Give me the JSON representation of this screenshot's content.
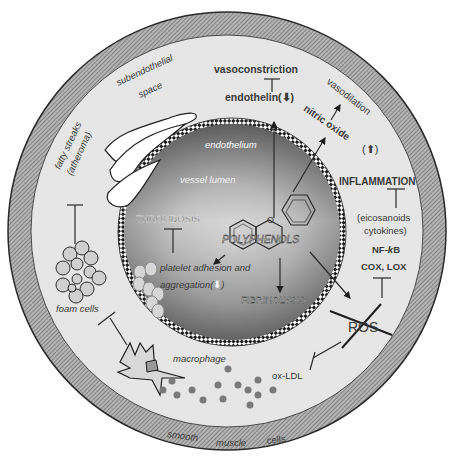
{
  "diagram": {
    "center": {
      "label": "POLYPHENOLS"
    },
    "regions": {
      "lumen": "vessel lumen",
      "endothelium": "endothelium",
      "subendothelial": "subendothelial space",
      "subendothelial_line1": "subendothelial",
      "subendothelial_line2": "space",
      "smooth_muscle": [
        "smooth",
        "muscle",
        "cells"
      ]
    },
    "labels": {
      "vasoconstriction": "vasoconstriction",
      "endothelin": "endothelin(",
      "endothelin_close": ")",
      "vasodilation": "vasodilation",
      "nitric_oxide": "nitric oxide",
      "inflammation": "INFLAMMATION",
      "eicosanoids": "(eicosanoids",
      "cytokines": "cytokines)",
      "nfkb_prefix": "NF-",
      "nfkb_k": "k",
      "nfkb_suffix": "B",
      "cox_lox": "COX, LOX",
      "ros": "ROS",
      "ox_ldl": "ox-LDL",
      "thrombosis": "THROMBOSIS",
      "platelet_line1": "platelet adhesion and",
      "platelet_line2": "aggregation(",
      "platelet_close": ")",
      "fibrinolysis": "FIBRINOLYSIS",
      "fatty_streaks_line1": "fatty streaks",
      "fatty_streaks_line2": "(atheroma)",
      "foam_cells": "foam cells",
      "macrophage": "macrophage"
    },
    "arrows": {
      "endothelin": "down",
      "nitric_oxide": "up",
      "platelet_aggregation": "down"
    },
    "colors": {
      "ring_outer": "#8a8a8a",
      "subendothelial_fill": "#e6e6e6",
      "lumen_dark": "#4a4a4a",
      "lumen_light": "#d8d8d8",
      "text": "#3a3a3a",
      "white": "#ffffff"
    }
  }
}
